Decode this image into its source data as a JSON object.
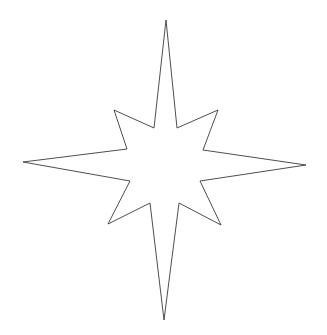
{
  "canvas": {
    "width": 327,
    "height": 335,
    "background": "#ffffff"
  },
  "star": {
    "shape": "eight-pointed-star",
    "stroke": "#3a3a3a",
    "fill": "#ffffff",
    "stroke_width": 0.9,
    "points": "166,20 177,128 218,110 203,150 306,165 200,181 221,225 179,203 164,320 150,203 108,224 130,181 23,162 127,149 114,110 154,128"
  }
}
